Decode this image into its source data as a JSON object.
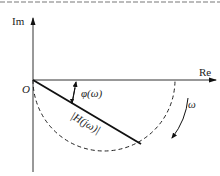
{
  "diagram": {
    "type": "complex-plane-locus",
    "axes": {
      "horizontal_label": "Re",
      "vertical_label": "Im",
      "origin_label": "O"
    },
    "vector": {
      "magnitude_label": "|H(jω)|",
      "angle_label": "φ(ω)"
    },
    "locus": {
      "style": "dashed semicircle below real axis",
      "direction_label": "ω"
    },
    "colors": {
      "line": "#111111",
      "axis": "#333333",
      "background": "#ffffff"
    }
  }
}
